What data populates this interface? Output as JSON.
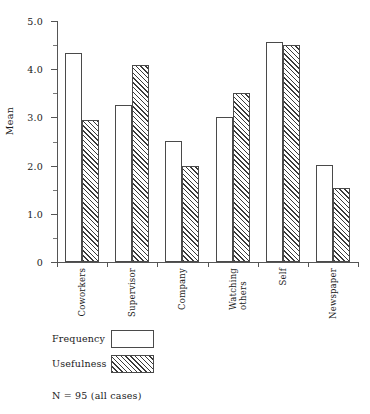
{
  "chart_data": {
    "type": "bar",
    "title": "",
    "subtitle": "",
    "xlabel": "",
    "ylabel": "Mean",
    "ylim": [
      0,
      5.0
    ],
    "grid": false,
    "legend_position": "below-left",
    "categories": [
      "Coworkers",
      "Supervisor",
      "Company",
      "Watching others",
      "Self",
      "Newspaper"
    ],
    "category_lines": [
      [
        "Coworkers"
      ],
      [
        "Supervisor"
      ],
      [
        "Company"
      ],
      [
        "Watching",
        "others"
      ],
      [
        "Self"
      ],
      [
        "Newspaper"
      ]
    ],
    "series": [
      {
        "name": "Frequency",
        "values": [
          4.33,
          3.26,
          2.51,
          3.0,
          4.56,
          2.01
        ]
      },
      {
        "name": "Usefulness",
        "values": [
          2.94,
          4.09,
          2.0,
          3.5,
          4.5,
          1.53
        ]
      }
    ],
    "y_ticks_major": [
      "0",
      "1.0",
      "2.0",
      "3.0",
      "4.0",
      "5.0"
    ],
    "y_tick_major_values": [
      0,
      1.0,
      2.0,
      3.0,
      4.0,
      5.0
    ],
    "y_tick_minor_values": [
      0.5,
      1.5,
      2.5,
      3.5,
      4.5
    ],
    "annotation": "N = 95 (all cases)",
    "colors": {
      "frequency_fill": "#ffffff",
      "usefulness_fill": "#ffffff",
      "hatch": "#3a3a3a",
      "axis": "#555555",
      "bar_outline": "#4a4a4a",
      "text": "#1a1a1a"
    }
  },
  "legend": {
    "items": [
      {
        "label": "Frequency",
        "style": "frequency"
      },
      {
        "label": "Usefulness",
        "style": "usefulness"
      }
    ]
  },
  "note": {
    "text": "N = 95 (all cases)"
  }
}
